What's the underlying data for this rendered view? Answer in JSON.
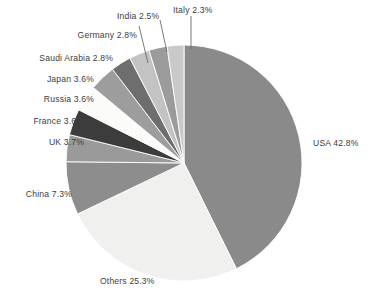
{
  "chart_data": {
    "type": "pie",
    "title": "",
    "xlabel": "",
    "ylabel": "",
    "legend_position": "none",
    "labels_outside": true,
    "start_angle_deg": 0,
    "direction": "clockwise",
    "categories": [
      "USA",
      "Others",
      "China",
      "UK",
      "France",
      "Russia",
      "Japan",
      "Saudi Arabia",
      "Germany",
      "India",
      "Italy"
    ],
    "values": [
      42.8,
      25.3,
      7.3,
      3.7,
      3.6,
      3.6,
      3.6,
      2.8,
      2.8,
      2.5,
      2.3
    ],
    "unit": "%",
    "colors": [
      "#8a8a8a",
      "#f0f0ee",
      "#8d8d8d",
      "#9a9a9a",
      "#3c3c3c",
      "#fbfbfa",
      "#9d9d9d",
      "#6e6e6e",
      "#c3c3c3",
      "#9b9b9b",
      "#c9c9c9"
    ],
    "slices": [
      {
        "label": "USA",
        "value": 42.8,
        "text": "USA 42.8%",
        "color": "#8a8a8a"
      },
      {
        "label": "Others",
        "value": 25.3,
        "text": "Others 25.3%",
        "color": "#f0f0ee"
      },
      {
        "label": "China",
        "value": 7.3,
        "text": "China 7.3%",
        "color": "#8d8d8d"
      },
      {
        "label": "UK",
        "value": 3.7,
        "text": "UK 3.7%",
        "color": "#9a9a9a"
      },
      {
        "label": "France",
        "value": 3.6,
        "text": "France 3.6%",
        "color": "#3c3c3c"
      },
      {
        "label": "Russia",
        "value": 3.6,
        "text": "Russia 3.6%",
        "color": "#fbfbfa"
      },
      {
        "label": "Japan",
        "value": 3.6,
        "text": "Japan 3.6%",
        "color": "#9d9d9d"
      },
      {
        "label": "Saudi Arabia",
        "value": 2.8,
        "text": "Saudi Arabia 2.8%",
        "color": "#6e6e6e"
      },
      {
        "label": "Germany",
        "value": 2.8,
        "text": "Germany 2.8%",
        "color": "#c3c3c3"
      },
      {
        "label": "India",
        "value": 2.5,
        "text": "India 2.5%",
        "color": "#9b9b9b"
      },
      {
        "label": "Italy",
        "value": 2.3,
        "text": "Italy 2.3%",
        "color": "#c9c9c9"
      }
    ]
  },
  "labels": {
    "usa": "USA 42.8%",
    "others": "Others 25.3%",
    "china": "China 7.3%",
    "uk": "UK 3.7%",
    "france": "France 3.6%",
    "russia": "Russia 3.6%",
    "japan": "Japan 3.6%",
    "saudi_arabia": "Saudi Arabia 2.8%",
    "germany": "Germany 2.8%",
    "india": "India 2.5%",
    "italy": "Italy 2.3%"
  }
}
